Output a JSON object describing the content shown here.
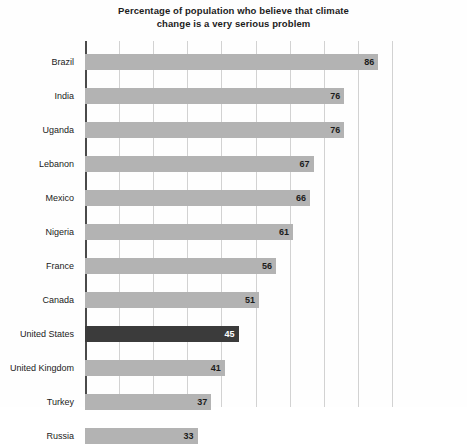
{
  "chart_data": {
    "type": "bar",
    "orientation": "horizontal",
    "title": "Percentage of population who believe that climate change is a very serious problem",
    "title_line_1": "Percentage of population who believe that climate",
    "title_line_2": "change is a very serious problem",
    "xlabel": "",
    "ylabel": "",
    "xlim": [
      0,
      90
    ],
    "grid": true,
    "gridline_interval": 10,
    "gridline_values": [
      0,
      10,
      20,
      30,
      40,
      50,
      60,
      70,
      80,
      90
    ],
    "legend": "none",
    "value_labels_shown": true,
    "categories": [
      "Brazil",
      "India",
      "Uganda",
      "Lebanon",
      "Mexico",
      "Nigeria",
      "France",
      "Canada",
      "United States",
      "United Kingdom",
      "Turkey",
      "Russia"
    ],
    "values": [
      86,
      76,
      76,
      67,
      66,
      61,
      56,
      51,
      45,
      41,
      37,
      33
    ],
    "bars": [
      {
        "category": "Brazil",
        "value": 86,
        "label": "86",
        "highlight": false
      },
      {
        "category": "India",
        "value": 76,
        "label": "76",
        "highlight": false
      },
      {
        "category": "Uganda",
        "value": 76,
        "label": "76",
        "highlight": false
      },
      {
        "category": "Lebanon",
        "value": 67,
        "label": "67",
        "highlight": false
      },
      {
        "category": "Mexico",
        "value": 66,
        "label": "66",
        "highlight": false
      },
      {
        "category": "Nigeria",
        "value": 61,
        "label": "61",
        "highlight": false
      },
      {
        "category": "France",
        "value": 56,
        "label": "56",
        "highlight": false
      },
      {
        "category": "Canada",
        "value": 51,
        "label": "51",
        "highlight": false
      },
      {
        "category": "United States",
        "value": 45,
        "label": "45",
        "highlight": true
      },
      {
        "category": "United Kingdom",
        "value": 41,
        "label": "41",
        "highlight": false
      },
      {
        "category": "Turkey",
        "value": 37,
        "label": "37",
        "highlight": false
      },
      {
        "category": "Russia",
        "value": 33,
        "label": "33",
        "highlight": false
      }
    ],
    "colors": {
      "bar": "#b3b3b3",
      "bar_highlight": "#3b3b3b",
      "gridline": "#d2d2d2",
      "axis": "#4a4a4a",
      "background": "#fefefe",
      "text": "#1c1c1c",
      "value_on_dark": "#ffffff"
    }
  }
}
